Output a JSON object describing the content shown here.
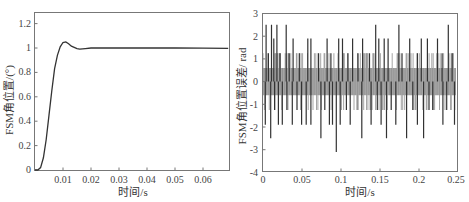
{
  "chart_data": [
    {
      "type": "line",
      "title": "",
      "xlabel": "时间/s",
      "ylabel": "FSM角位置/(°)",
      "xlim": [
        0,
        0.069
      ],
      "ylim": [
        0,
        1.3
      ],
      "x_ticks": [
        "0.01",
        "0.02",
        "0.03",
        "0.04",
        "0.05",
        "0.06"
      ],
      "y_ticks": [
        "0",
        "0.2",
        "0.4",
        "0.6",
        "0.8",
        "1",
        "1.2"
      ],
      "grid": false,
      "legend": null,
      "series": [
        {
          "name": "step response",
          "x": [
            0,
            0.001,
            0.002,
            0.003,
            0.004,
            0.005,
            0.006,
            0.007,
            0.008,
            0.009,
            0.01,
            0.011,
            0.012,
            0.013,
            0.014,
            0.015,
            0.016,
            0.018,
            0.02,
            0.025,
            0.03,
            0.04,
            0.05,
            0.06,
            0.069
          ],
          "values": [
            0,
            0.0,
            0.02,
            0.1,
            0.25,
            0.45,
            0.65,
            0.83,
            0.94,
            1.01,
            1.045,
            1.05,
            1.035,
            1.015,
            1.005,
            0.995,
            0.99,
            0.995,
            1.0,
            1.0,
            1.0,
            1.0,
            1.0,
            0.998,
            0.997
          ]
        }
      ]
    },
    {
      "type": "line",
      "title": "",
      "xlabel": "时间/s",
      "ylabel": "FSM角位置误差/ rad",
      "xlim": [
        0,
        0.25
      ],
      "ylim": [
        -4,
        3
      ],
      "x_ticks": [
        "0",
        "0.05",
        "0.1",
        "0.15",
        "0.2",
        "0.25"
      ],
      "y_ticks": [
        "-4",
        "-3",
        "-2",
        "-1",
        "0",
        "1",
        "2",
        "3"
      ],
      "grid": false,
      "legend": null,
      "series": [
        {
          "name": "position error",
          "description": "quantized noise mostly in ±0.6, frequent spikes to ±1.25 / ±1.9 / ±2.5, one dip to about -3.1 near t=0.095",
          "spikes_up": [
            [
              0.004,
              2.5
            ],
            [
              0.007,
              1.25
            ],
            [
              0.011,
              2.5
            ],
            [
              0.014,
              1.9
            ],
            [
              0.018,
              2.5
            ],
            [
              0.022,
              1.25
            ],
            [
              0.03,
              2.5
            ],
            [
              0.034,
              1.25
            ],
            [
              0.039,
              1.9
            ],
            [
              0.047,
              1.25
            ],
            [
              0.058,
              1.9
            ],
            [
              0.062,
              1.9
            ],
            [
              0.072,
              1.25
            ],
            [
              0.083,
              1.9
            ],
            [
              0.088,
              1.25
            ],
            [
              0.098,
              1.9
            ],
            [
              0.103,
              1.9
            ],
            [
              0.11,
              1.25
            ],
            [
              0.116,
              1.9
            ],
            [
              0.123,
              1.25
            ],
            [
              0.129,
              1.9
            ],
            [
              0.138,
              1.25
            ],
            [
              0.146,
              2.5
            ],
            [
              0.15,
              1.9
            ],
            [
              0.157,
              1.9
            ],
            [
              0.162,
              1.9
            ],
            [
              0.176,
              2.5
            ],
            [
              0.18,
              1.25
            ],
            [
              0.19,
              1.9
            ],
            [
              0.2,
              1.25
            ],
            [
              0.205,
              1.9
            ],
            [
              0.213,
              1.9
            ],
            [
              0.226,
              1.9
            ],
            [
              0.232,
              1.25
            ],
            [
              0.24,
              2.5
            ],
            [
              0.245,
              1.25
            ]
          ],
          "spikes_down": [
            [
              0.003,
              -1.9
            ],
            [
              0.01,
              -2.5
            ],
            [
              0.015,
              -1.25
            ],
            [
              0.02,
              -1.9
            ],
            [
              0.025,
              -1.9
            ],
            [
              0.031,
              -1.25
            ],
            [
              0.038,
              -1.9
            ],
            [
              0.044,
              -1.25
            ],
            [
              0.05,
              -1.9
            ],
            [
              0.056,
              -1.9
            ],
            [
              0.062,
              -1.9
            ],
            [
              0.075,
              -2.5
            ],
            [
              0.08,
              -1.25
            ],
            [
              0.086,
              -1.9
            ],
            [
              0.09,
              -1.9
            ],
            [
              0.095,
              -3.1
            ],
            [
              0.1,
              -1.9
            ],
            [
              0.108,
              -1.25
            ],
            [
              0.113,
              -1.9
            ],
            [
              0.128,
              -2.5
            ],
            [
              0.14,
              -1.9
            ],
            [
              0.148,
              -1.25
            ],
            [
              0.153,
              -1.9
            ],
            [
              0.16,
              -2.5
            ],
            [
              0.166,
              -1.25
            ],
            [
              0.172,
              -1.9
            ],
            [
              0.186,
              -2.5
            ],
            [
              0.194,
              -1.25
            ],
            [
              0.2,
              -1.9
            ],
            [
              0.208,
              -2.5
            ],
            [
              0.215,
              -1.25
            ],
            [
              0.22,
              -1.25
            ],
            [
              0.233,
              -1.9
            ],
            [
              0.238,
              -1.25
            ],
            [
              0.248,
              -1.9
            ]
          ]
        }
      ]
    }
  ],
  "left": {
    "xlabel": "时间/s",
    "ylabel": "FSM角位置/(°)",
    "x_ticks": [
      "0.01",
      "0.02",
      "0.03",
      "0.04",
      "0.05",
      "0.06"
    ],
    "y_ticks": [
      "0",
      "0.2",
      "0.4",
      "0.6",
      "0.8",
      "1",
      "1.2"
    ]
  },
  "right": {
    "xlabel": "时间/s",
    "ylabel": "FSM角位置误差/ rad",
    "x_ticks": [
      "0",
      "0.05",
      "0.1",
      "0.15",
      "0.2",
      "0.25"
    ],
    "y_ticks": [
      "3",
      "2",
      "1",
      "0",
      "-1",
      "-2",
      "-3",
      "-4"
    ]
  },
  "colors": {
    "line": "#333333",
    "frame": "#777777",
    "noise": "#555555"
  }
}
